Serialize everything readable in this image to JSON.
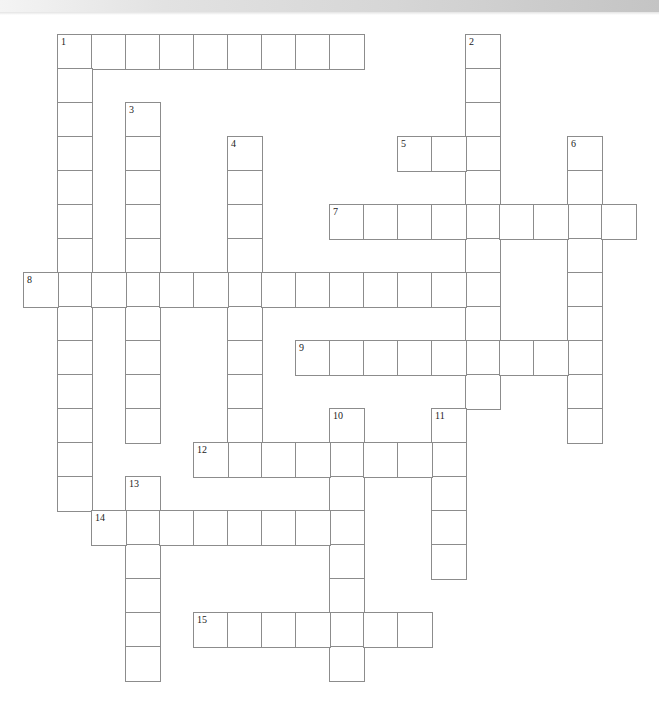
{
  "page": {
    "type": "crossword-puzzle",
    "header_fragment": ""
  },
  "crossword": {
    "rows": 19,
    "cols": 18,
    "entries": [
      {
        "number": "1",
        "direction": "across",
        "row": 0,
        "col": 1,
        "length": 9
      },
      {
        "number": "1",
        "direction": "down",
        "row": 0,
        "col": 1,
        "length": 14
      },
      {
        "number": "2",
        "direction": "down",
        "row": 0,
        "col": 13,
        "length": 11
      },
      {
        "number": "3",
        "direction": "down",
        "row": 2,
        "col": 3,
        "length": 10
      },
      {
        "number": "4",
        "direction": "down",
        "row": 3,
        "col": 6,
        "length": 10
      },
      {
        "number": "5",
        "direction": "across",
        "row": 3,
        "col": 11,
        "length": 3
      },
      {
        "number": "6",
        "direction": "down",
        "row": 3,
        "col": 16,
        "length": 9
      },
      {
        "number": "7",
        "direction": "across",
        "row": 5,
        "col": 9,
        "length": 9
      },
      {
        "number": "8",
        "direction": "across",
        "row": 7,
        "col": 0,
        "length": 14
      },
      {
        "number": "9",
        "direction": "across",
        "row": 9,
        "col": 8,
        "length": 9
      },
      {
        "number": "10",
        "direction": "down",
        "row": 11,
        "col": 9,
        "length": 8
      },
      {
        "number": "11",
        "direction": "down",
        "row": 11,
        "col": 12,
        "length": 5
      },
      {
        "number": "12",
        "direction": "across",
        "row": 12,
        "col": 5,
        "length": 8
      },
      {
        "number": "13",
        "direction": "down",
        "row": 13,
        "col": 3,
        "length": 6
      },
      {
        "number": "14",
        "direction": "across",
        "row": 14,
        "col": 2,
        "length": 8
      },
      {
        "number": "15",
        "direction": "across",
        "row": 17,
        "col": 5,
        "length": 7
      }
    ],
    "colors": {
      "border": "#8c8c8c",
      "cell": "#ffffff",
      "number": "#222222"
    }
  }
}
